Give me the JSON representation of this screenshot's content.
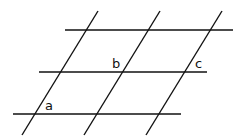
{
  "diagram": {
    "stroke_color": "#111111",
    "horizontal_lines": [
      {
        "x1": 65,
        "y1": 30,
        "x2": 233,
        "y2": 30
      },
      {
        "x1": 39,
        "y1": 72,
        "x2": 207,
        "y2": 72
      },
      {
        "x1": 13,
        "y1": 114,
        "x2": 181,
        "y2": 114
      }
    ],
    "transversals": [
      {
        "x1": 98,
        "y1": 11,
        "x2": 22,
        "y2": 135
      },
      {
        "x1": 160,
        "y1": 11,
        "x2": 84,
        "y2": 135
      },
      {
        "x1": 222,
        "y1": 11,
        "x2": 146,
        "y2": 135
      }
    ],
    "labels": {
      "a": "a",
      "b": "b",
      "c": "c"
    }
  }
}
